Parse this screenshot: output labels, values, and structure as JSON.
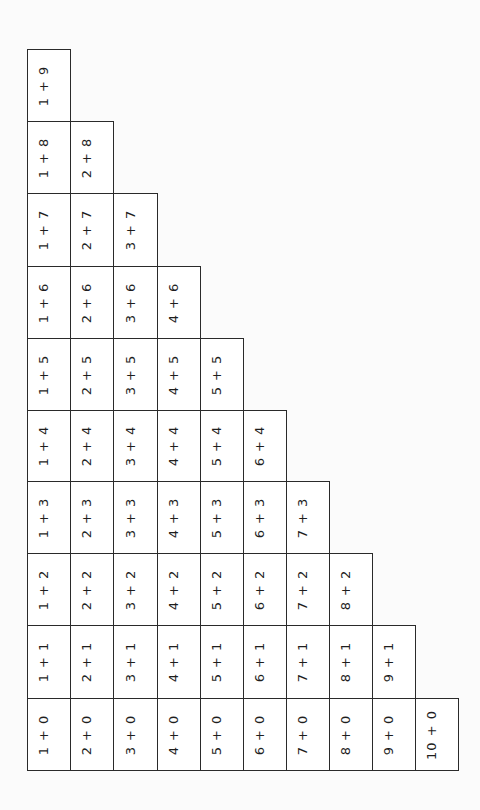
{
  "layout": {
    "col_edges": [
      27,
      70,
      113,
      157,
      200,
      243,
      286,
      329,
      372,
      415,
      458
    ],
    "row_edges": [
      49,
      121,
      193,
      266,
      338,
      410,
      481,
      553,
      625,
      698,
      770
    ],
    "text_rotation_deg": -90
  },
  "colors": {
    "border": "#2a2a2a",
    "text": "#1e1e1e",
    "background": "#fbfbfb"
  },
  "table": {
    "orientation": "rotated 90° counter-clockwise; screen columns = first addend, screen rows = second addend (9 at top → 0 at bottom)",
    "columns": [
      {
        "first": 1,
        "cells": [
          "1 + 9",
          "1 + 8",
          "1 + 7",
          "1 + 6",
          "1 + 5",
          "1 + 4",
          "1 + 3",
          "1 + 2",
          "1 + 1",
          "1 + 0"
        ]
      },
      {
        "first": 2,
        "cells": [
          "2 + 8",
          "2 + 7",
          "2 + 6",
          "2 + 5",
          "2 + 4",
          "2 + 3",
          "2 + 2",
          "2 + 1",
          "2 + 0"
        ]
      },
      {
        "first": 3,
        "cells": [
          "3 + 7",
          "3 + 6",
          "3 + 5",
          "3 + 4",
          "3 + 3",
          "3 + 2",
          "3 + 1",
          "3 + 0"
        ]
      },
      {
        "first": 4,
        "cells": [
          "4 + 6",
          "4 + 5",
          "4 + 4",
          "4 + 3",
          "4 + 2",
          "4 + 1",
          "4 + 0"
        ]
      },
      {
        "first": 5,
        "cells": [
          "5 + 5",
          "5 + 4",
          "5 + 3",
          "5 + 2",
          "5 + 1",
          "5 + 0"
        ]
      },
      {
        "first": 6,
        "cells": [
          "6 + 4",
          "6 + 3",
          "6 + 2",
          "6 + 1",
          "6 + 0"
        ]
      },
      {
        "first": 7,
        "cells": [
          "7 + 3",
          "7 + 2",
          "7 + 1",
          "7 + 0"
        ]
      },
      {
        "first": 8,
        "cells": [
          "8 + 2",
          "8 + 1",
          "8 + 0"
        ]
      },
      {
        "first": 9,
        "cells": [
          "9 + 1",
          "9 + 0"
        ]
      },
      {
        "first": 10,
        "cells": [
          "10 + 0"
        ]
      }
    ]
  }
}
